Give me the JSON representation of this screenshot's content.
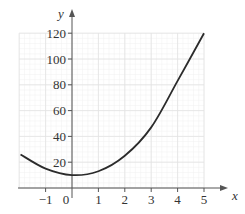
{
  "chart_data": {
    "type": "line",
    "title": "",
    "xlabel": "x",
    "ylabel": "y",
    "xlim": [
      -2,
      5
    ],
    "ylim": [
      0,
      120
    ],
    "grid": true,
    "legend": null,
    "x_ticks": [
      "-1",
      "0",
      "1",
      "2",
      "3",
      "4",
      "5"
    ],
    "y_ticks": [
      "20",
      "40",
      "60",
      "80",
      "100",
      "120"
    ],
    "series": [
      {
        "name": "curve",
        "x": [
          -1.95,
          -1,
          0,
          1,
          2,
          3,
          4,
          5
        ],
        "values": [
          26,
          15,
          10,
          13,
          25,
          47,
          83,
          120
        ]
      }
    ],
    "colors": {
      "curve": "#2b2b2b",
      "axes": "#555555",
      "grid_major": "#e2e2e2",
      "grid_minor": "#f1f1f1"
    }
  }
}
